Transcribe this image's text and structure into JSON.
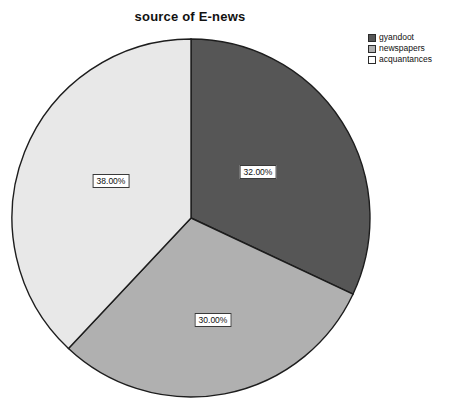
{
  "chart": {
    "title": "source of E-news"
  },
  "legend": {
    "items": [
      {
        "label": "gyandoot",
        "color": "#565656"
      },
      {
        "label": "newspapers",
        "color": "#b0b0b0"
      },
      {
        "label": "acquantances",
        "color": "#ffffff"
      }
    ]
  },
  "labels": {
    "gyandoot": "32.00%",
    "newspapers": "30.00%",
    "acquantances": "38.00%"
  },
  "chart_data": {
    "type": "pie",
    "title": "source of E-news",
    "xlabel": "",
    "ylabel": "",
    "categories": [
      "gyandoot",
      "newspapers",
      "acquantances"
    ],
    "values": [
      32.0,
      30.0,
      38.0
    ],
    "data_labels": [
      "32.00%",
      "30.00%",
      "38.00%"
    ],
    "colors": [
      "#565656",
      "#b0b0b0",
      "#e8e8e8"
    ],
    "legend_entries": [
      "gyandoot",
      "newspapers",
      "acquantances"
    ],
    "legend_position": "top-right",
    "start_angle_deg": 90,
    "direction": "clockwise",
    "units": "percent",
    "grid": false
  }
}
